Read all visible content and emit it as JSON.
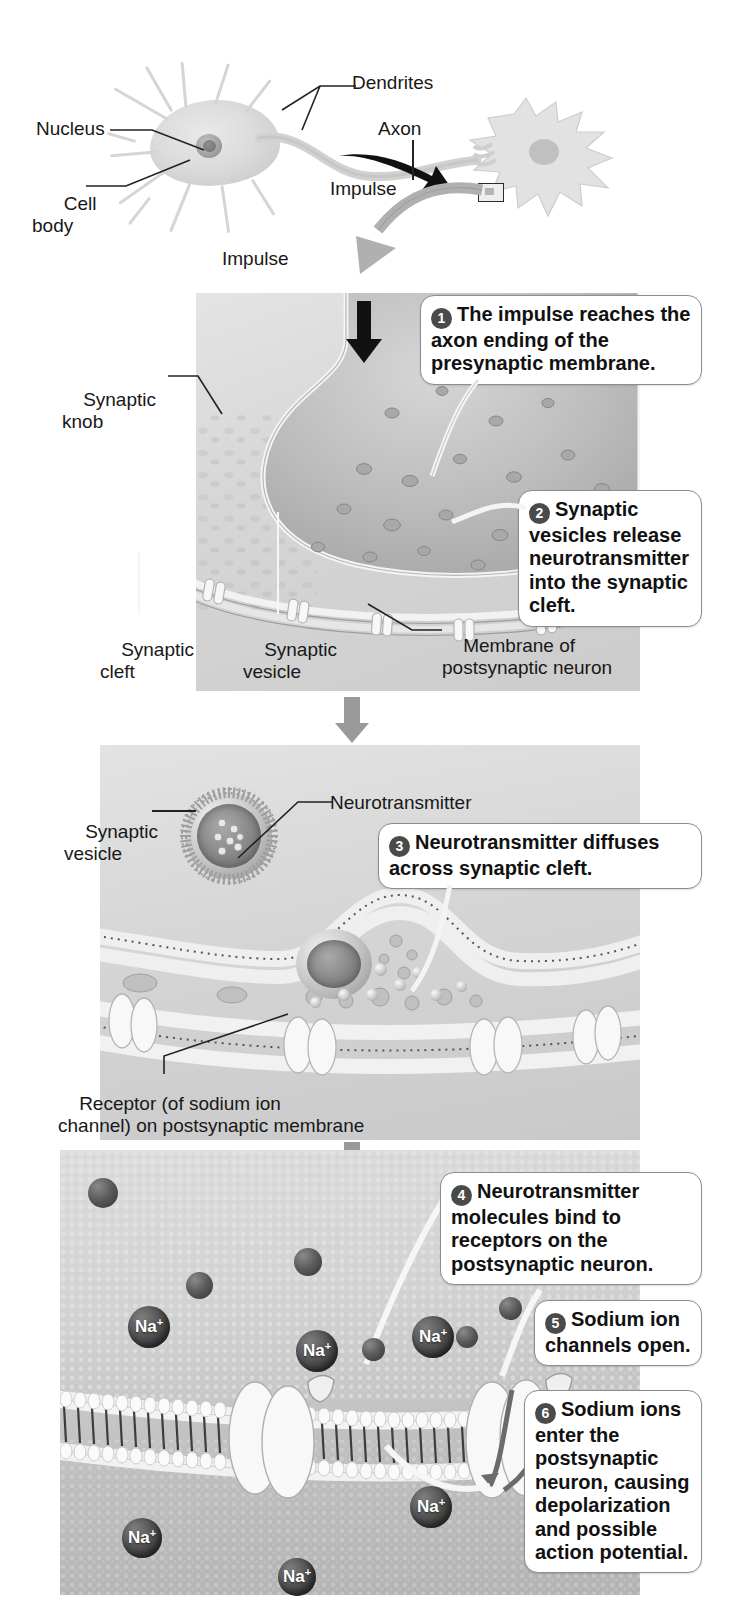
{
  "figure": {
    "colors": {
      "callout_border": "#8d8d8d",
      "callout_bg": "#ffffff",
      "step_arrow": "#9a9a9a",
      "impulse_arrow_dark": "#111111",
      "ion": "#3a3a3a",
      "panel_bg": "#d8d8d8",
      "text": "#181818"
    }
  },
  "overview": {
    "labels": {
      "dendrites": "Dendrites",
      "nucleus": "Nucleus",
      "cell_body": "Cell\nbody",
      "axon": "Axon",
      "impulse": "Impulse"
    },
    "zoom_impulse_label": "Impulse"
  },
  "panel1": {
    "labels": {
      "synaptic_knob": "Synaptic\nknob",
      "synaptic_cleft": "Synaptic\ncleft",
      "synaptic_vesicle": "Synaptic\nvesicle",
      "membrane_postsynaptic": "Membrane of\npostsynaptic neuron"
    },
    "callouts": [
      {
        "number": "1",
        "text": "The impulse reaches the axon ending of the presynaptic membrane."
      },
      {
        "number": "2",
        "text": "Synaptic vesicles release neurotransmitter into the synaptic cleft."
      }
    ]
  },
  "panel2": {
    "labels": {
      "synaptic_vesicle": "Synaptic\nvesicle",
      "neurotransmitter": "Neurotransmitter",
      "receptor": "Receptor (of sodium ion\nchannel) on postsynaptic membrane"
    },
    "callouts": [
      {
        "number": "3",
        "text": "Neurotransmitter diffuses across synaptic cleft."
      }
    ]
  },
  "panel3": {
    "ion_label": "Na",
    "ion_charge": "+",
    "ions": [
      {
        "x": 128,
        "y": 1230,
        "size": 40
      },
      {
        "x": 262,
        "y": 1282,
        "size": 34
      },
      {
        "x": 412,
        "y": 1279,
        "size": 34
      },
      {
        "x": 418,
        "y": 1332,
        "size": 44
      },
      {
        "x": 120,
        "y": 1176,
        "size": 30
      },
      {
        "x": 366,
        "y": 1342,
        "size": 26
      },
      {
        "x": 135,
        "y": 1490,
        "size": 40
      },
      {
        "x": 236,
        "y": 1556,
        "size": 36
      },
      {
        "x": 430,
        "y": 1462,
        "size": 44
      },
      {
        "x": 455,
        "y": 1322,
        "size": 38
      },
      {
        "x": 500,
        "y": 1300,
        "size": 24
      }
    ],
    "callouts": [
      {
        "number": "4",
        "text": "Neurotransmitter molecules bind to receptors on the postsynaptic neuron."
      },
      {
        "number": "5",
        "text": "Sodium ion channels open."
      },
      {
        "number": "6",
        "text": "Sodium ions enter the postsynaptic neuron, causing depolarization and possible action potential."
      }
    ]
  }
}
